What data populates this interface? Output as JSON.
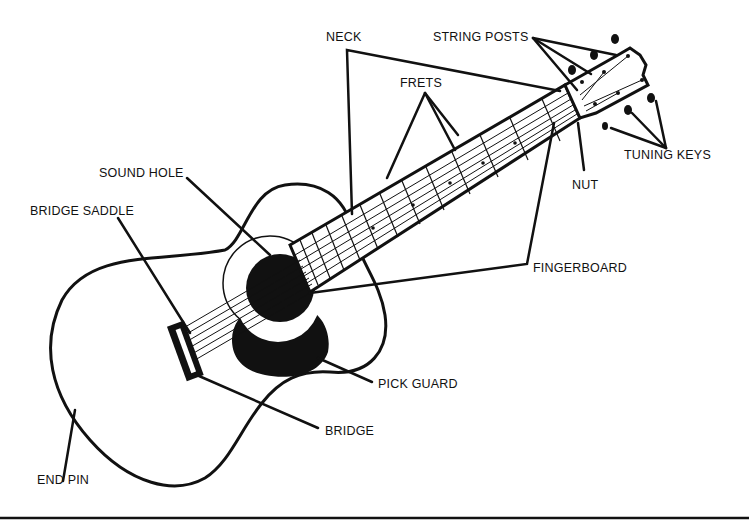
{
  "diagram": {
    "labels": {
      "neck": "NECK",
      "string_posts": "STRING POSTS",
      "frets": "FRETS",
      "tuning_keys": "TUNING KEYS",
      "nut": "NUT",
      "sound_hole": "SOUND HOLE",
      "bridge_saddle": "BRIDGE SADDLE",
      "fingerboard": "FINGERBOARD",
      "pick_guard": "PICK GUARD",
      "bridge": "BRIDGE",
      "end_pin": "END PIN"
    },
    "colors": {
      "ink": "#111111",
      "paper": "#ffffff"
    }
  }
}
